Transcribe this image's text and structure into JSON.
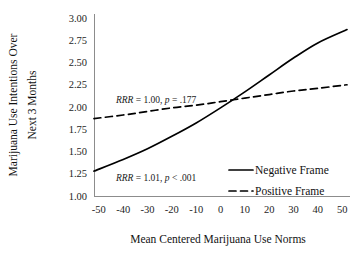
{
  "chart_data": {
    "type": "line",
    "title": "",
    "xlabel": "Mean Centered Marijuana Use Norms",
    "ylabel_line1": "Marijuana Use Intentions Over",
    "ylabel_line2": "Next 3 Months",
    "xlim": [
      -52,
      52
    ],
    "ylim": [
      1.0,
      3.0
    ],
    "xticks": [
      -50,
      -40,
      -30,
      -20,
      -10,
      0,
      10,
      20,
      30,
      40,
      50
    ],
    "xtick_labels": [
      "-50",
      "-40",
      "-30",
      "-20",
      "-10",
      "0",
      "10",
      "20",
      "30",
      "40",
      "50"
    ],
    "yticks": [
      1.0,
      1.25,
      1.5,
      1.75,
      2.0,
      2.25,
      2.5,
      2.75,
      3.0
    ],
    "ytick_labels": [
      "1.00",
      "1.25",
      "1.50",
      "1.75",
      "2.00",
      "2.25",
      "2.50",
      "2.75",
      "3.00"
    ],
    "grid": false,
    "legend_position": "center-right",
    "x": [
      -52,
      -40,
      -30,
      -20,
      -10,
      0,
      10,
      20,
      30,
      40,
      52
    ],
    "series": [
      {
        "name": "Negative Frame",
        "style": "solid",
        "values": [
          1.28,
          1.41,
          1.53,
          1.67,
          1.82,
          1.99,
          2.17,
          2.36,
          2.55,
          2.72,
          2.87
        ]
      },
      {
        "name": "Positive Frame",
        "style": "dashed",
        "values": [
          1.87,
          1.91,
          1.95,
          1.99,
          2.02,
          2.06,
          2.1,
          2.14,
          2.18,
          2.21,
          2.25
        ]
      }
    ],
    "annotations": [
      {
        "id": "positive-frame-stat",
        "text": "RRR = 1.00, p = .177",
        "stat_label": "RRR",
        "stat_eq": " = 1.00, ",
        "p_label": "p",
        "p_value": " = .177",
        "x": -43,
        "y": 2.04
      },
      {
        "id": "negative-frame-stat",
        "text": "RRR = 1.01, p < .001",
        "stat_label": "RRR",
        "stat_eq": " = 1.01, ",
        "p_label": "p",
        "p_value": " < .001",
        "x": -43,
        "y": 1.17
      }
    ],
    "legend_entries": [
      {
        "label": "Negative Frame",
        "style": "solid"
      },
      {
        "label": "Positive Frame",
        "style": "dashed"
      }
    ],
    "colors": {
      "line": "#000000",
      "axis": "#8c8c8c",
      "text": "#1a1a1a",
      "background": "#ffffff"
    }
  }
}
